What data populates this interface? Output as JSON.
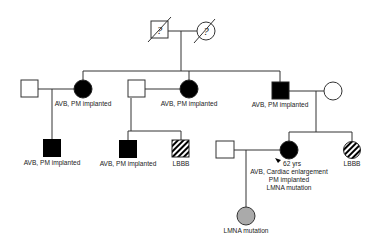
{
  "diagram": {
    "type": "pedigree",
    "generation_I": {
      "father": {
        "sex": "male",
        "status": "deceased",
        "symbol_text": "?"
      },
      "mother": {
        "sex": "female",
        "status": "deceased",
        "symbol_text": "?"
      }
    },
    "labels": {
      "II_1": "AVB, PM implanted",
      "II_2": "AVB, PM implanted",
      "II_3": "AVB, PM implanted",
      "III_1": "AVB, PM implanted",
      "III_2": "AVB, PM implanted",
      "III_3": "LBBB",
      "proband_age": "62 yrs",
      "proband_line1": "AVB, Cardiac enlargement",
      "proband_line2": "PM implanted",
      "proband_line3": "LMNA mutation",
      "III_5": "LBBB",
      "IV_1": "LMNA mutation"
    },
    "legend_colors": {
      "affected": "#000000",
      "unaffected": "#ffffff",
      "carrier": "#aaaaaa",
      "hatched": "striped"
    }
  }
}
